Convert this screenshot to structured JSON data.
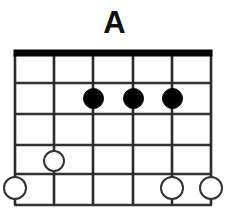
{
  "diagram": {
    "title": "A",
    "instrument_strings": 6,
    "fret_count": 5,
    "colors": {
      "background": "#ffffff",
      "nut": "#000000",
      "string": "#2b2b2b",
      "fret": "#333333",
      "filled_dot": "#000000",
      "open_dot_stroke": "#333333",
      "open_dot_fill": "#ffffff",
      "title": "#111111"
    },
    "geometry": {
      "left": 15,
      "right": 211,
      "nut_y": 53,
      "nut_thickness": 7,
      "string_x": [
        15,
        54,
        93,
        133,
        172,
        211
      ],
      "fret_y": [
        83,
        114,
        145,
        174,
        205
      ]
    },
    "nut": {
      "label": "nut",
      "visible": true
    },
    "strings": [
      {
        "index": 1,
        "label": "string-1",
        "x": 15
      },
      {
        "index": 2,
        "label": "string-2",
        "x": 54
      },
      {
        "index": 3,
        "label": "string-3",
        "x": 93
      },
      {
        "index": 4,
        "label": "string-4",
        "x": 133
      },
      {
        "index": 5,
        "label": "string-5",
        "x": 172
      },
      {
        "index": 6,
        "label": "string-6",
        "x": 211
      }
    ],
    "frets": [
      {
        "index": 1,
        "label": "fret-line-1",
        "y": 83
      },
      {
        "index": 2,
        "label": "fret-line-2",
        "y": 114
      },
      {
        "index": 3,
        "label": "fret-line-3",
        "y": 145
      },
      {
        "index": 4,
        "label": "fret-line-4",
        "y": 174
      },
      {
        "index": 5,
        "label": "fret-line-5",
        "y": 205
      }
    ],
    "markers": [
      {
        "id": "m1",
        "type": "filled",
        "label": "fingered-note",
        "x": 93,
        "y": 98,
        "d": 21
      },
      {
        "id": "m2",
        "type": "filled",
        "label": "fingered-note",
        "x": 133,
        "y": 98,
        "d": 21
      },
      {
        "id": "m3",
        "type": "filled",
        "label": "fingered-note",
        "x": 172,
        "y": 98,
        "d": 21
      },
      {
        "id": "m4",
        "type": "open",
        "label": "open-note",
        "x": 54,
        "y": 161,
        "d": 22
      },
      {
        "id": "m5",
        "type": "open",
        "label": "open-note",
        "x": 15,
        "y": 188,
        "d": 24
      },
      {
        "id": "m6",
        "type": "open",
        "label": "open-note",
        "x": 172,
        "y": 188,
        "d": 24
      },
      {
        "id": "m7",
        "type": "open",
        "label": "open-note",
        "x": 211,
        "y": 188,
        "d": 24
      }
    ]
  }
}
